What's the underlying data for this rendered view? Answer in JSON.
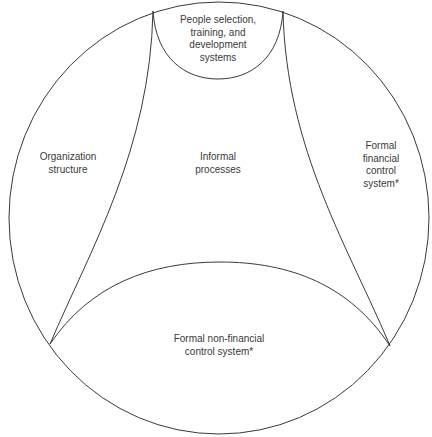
{
  "diagram": {
    "type": "nested-region diagram",
    "regions": [
      {
        "id": "people",
        "lines": [
          "People selection,",
          "training, and",
          "development",
          "systems"
        ]
      },
      {
        "id": "organization",
        "lines": [
          "Organization",
          "structure"
        ]
      },
      {
        "id": "informal",
        "lines": [
          "Informal",
          "processes"
        ]
      },
      {
        "id": "financial",
        "lines": [
          "Formal",
          "financial",
          "control",
          "system*"
        ]
      },
      {
        "id": "nonfinancial",
        "lines": [
          "Formal non-financial",
          "control system*"
        ]
      }
    ],
    "colors": {
      "stroke": "#3a3a3a",
      "text": "#3a3a3a",
      "background": "#ffffff"
    }
  }
}
